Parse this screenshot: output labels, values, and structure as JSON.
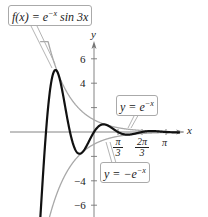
{
  "chart_data": {
    "type": "line",
    "title": "",
    "xlabel": "x",
    "ylabel": "y",
    "xlim": [
      -2.6,
      3.9
    ],
    "ylim": [
      -7.0,
      7.5
    ],
    "grid": false,
    "x_ticks": [
      {
        "value": 1.0472,
        "label_num": "π",
        "label_den": "3"
      },
      {
        "value": 2.0944,
        "label_num": "2π",
        "label_den": "3"
      },
      {
        "value": 3.1416,
        "label": "π"
      }
    ],
    "y_ticks": [
      {
        "value": 6,
        "label": "6"
      },
      {
        "value": 4,
        "label": "4"
      },
      {
        "value": 2,
        "label": ""
      },
      {
        "value": -2,
        "label": ""
      },
      {
        "value": -4,
        "label": "−4"
      },
      {
        "value": -6,
        "label": "−6"
      }
    ],
    "series": [
      {
        "name": "f(x) = e^{-x} sin 3x",
        "expression": "exp(-x)*sin(3*x)",
        "color": "#111111",
        "style": "thick"
      },
      {
        "name": "y = e^{-x}",
        "expression": "exp(-x)",
        "color": "#a8a8a8",
        "style": "thin"
      },
      {
        "name": "y = −e^{-x}",
        "expression": "-exp(-x)",
        "color": "#a8a8a8",
        "style": "thin"
      }
    ],
    "annotations": [
      {
        "text": "f(x) = e^{−x} sin 3x",
        "target": "f"
      },
      {
        "text": "y = e^{−x}",
        "target": "upper envelope"
      },
      {
        "text": "y = −e^{−x}",
        "target": "lower envelope"
      }
    ]
  },
  "labels": {
    "f_label_prefix": "f(x) = e",
    "f_label_exp": "−x",
    "f_label_suffix": " sin 3x",
    "upper_prefix": "y = e",
    "upper_exp": "−x",
    "lower_prefix": "y = −e",
    "lower_exp": "−x",
    "x_axis": "x",
    "y_axis": "y",
    "tick_pi3_num": "π",
    "tick_pi3_den": "3",
    "tick_2pi3_num": "2π",
    "tick_2pi3_den": "3",
    "tick_pi": "π",
    "tick_y6": "6",
    "tick_y4": "4",
    "tick_yn4": "−4",
    "tick_yn6": "−6"
  }
}
